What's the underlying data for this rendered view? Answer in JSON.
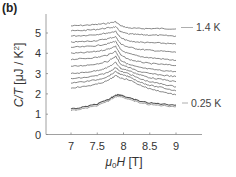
{
  "panel_label": "(b)",
  "chart_data": {
    "type": "line",
    "title": "",
    "xlabel": "μ0H [T]",
    "ylabel": "C/T [μJ / K²]",
    "xlim": [
      6.5,
      9.5
    ],
    "ylim": [
      0,
      5.8
    ],
    "xticks": [
      7,
      7.5,
      8,
      8.5,
      9
    ],
    "yticks": [
      0,
      1,
      2,
      3,
      4,
      5
    ],
    "grid": false,
    "annotations": [
      {
        "text": "1.4 K",
        "x": 9.0,
        "y": 5.2,
        "position": "right of top curve"
      },
      {
        "text": "0.25 K",
        "x": 9.0,
        "y": 1.5,
        "position": "right of bottom curve"
      }
    ],
    "x": [
      7.0,
      7.25,
      7.5,
      7.7,
      7.85,
      7.95,
      8.1,
      8.3,
      8.5,
      8.75,
      9.0
    ],
    "series": [
      {
        "name": "1.4 K",
        "values": [
          5.35,
          5.38,
          5.42,
          5.48,
          5.55,
          5.35,
          5.25,
          5.22,
          5.22,
          5.22,
          5.2
        ]
      },
      {
        "name": "curve 2",
        "values": [
          5.1,
          5.13,
          5.18,
          5.25,
          5.3,
          5.05,
          4.95,
          4.92,
          4.9,
          4.88,
          4.85
        ]
      },
      {
        "name": "curve 3",
        "values": [
          4.85,
          4.88,
          4.93,
          5.0,
          5.08,
          4.75,
          4.6,
          4.55,
          4.52,
          4.5,
          4.45
        ]
      },
      {
        "name": "curve 4",
        "values": [
          4.55,
          4.58,
          4.63,
          4.72,
          4.82,
          4.45,
          4.3,
          4.2,
          4.15,
          4.1,
          4.05
        ]
      },
      {
        "name": "curve 5",
        "values": [
          4.3,
          4.32,
          4.38,
          4.47,
          4.6,
          4.15,
          3.98,
          3.85,
          3.78,
          3.72,
          3.65
        ]
      },
      {
        "name": "curve 6",
        "values": [
          4.0,
          4.03,
          4.1,
          4.2,
          4.35,
          3.9,
          3.7,
          3.58,
          3.5,
          3.45,
          3.4
        ]
      },
      {
        "name": "curve 7",
        "values": [
          3.7,
          3.74,
          3.8,
          3.92,
          4.1,
          3.65,
          3.45,
          3.3,
          3.22,
          3.15,
          3.1
        ]
      },
      {
        "name": "curve 8",
        "values": [
          3.35,
          3.4,
          3.48,
          3.6,
          3.85,
          3.45,
          3.3,
          3.1,
          3.0,
          2.92,
          2.85
        ]
      },
      {
        "name": "curve 9",
        "values": [
          3.0,
          3.05,
          3.15,
          3.3,
          3.55,
          3.25,
          3.15,
          2.95,
          2.8,
          2.7,
          2.6
        ]
      },
      {
        "name": "curve 10",
        "values": [
          2.75,
          2.8,
          2.9,
          3.05,
          3.3,
          3.1,
          3.0,
          2.75,
          2.6,
          2.48,
          2.35
        ]
      },
      {
        "name": "curve 11",
        "values": [
          2.55,
          2.6,
          2.7,
          2.85,
          3.1,
          2.95,
          2.85,
          2.6,
          2.42,
          2.3,
          2.15
        ]
      },
      {
        "name": "curve 12",
        "values": [
          2.3,
          2.36,
          2.48,
          2.65,
          2.9,
          2.78,
          2.7,
          2.45,
          2.25,
          2.1,
          1.95
        ]
      },
      {
        "name": "0.25 K",
        "values": [
          1.25,
          1.35,
          1.5,
          1.7,
          1.95,
          1.95,
          1.8,
          1.65,
          1.55,
          1.5,
          1.45
        ]
      }
    ]
  }
}
